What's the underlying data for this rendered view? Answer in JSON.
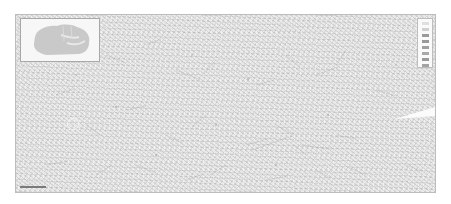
{
  "map": {
    "type": "topographic-map-sheet",
    "background_color": "#e9e9e9",
    "frame_color": "#bdbdbd"
  },
  "overview_inset": {
    "shape_color": "#c9c9c9",
    "background_color": "#f7f7f7"
  },
  "legend": {
    "rows": [
      {
        "color": "#e0e0e0"
      },
      {
        "color": "#d0d0d0"
      },
      {
        "color": "#9a9a9a"
      },
      {
        "color": "#9a9a9a"
      },
      {
        "color": "#a0a0a0"
      },
      {
        "color": "#a8a8a8"
      },
      {
        "color": "#9a9a9a"
      },
      {
        "color": "#a3a3a3"
      }
    ]
  },
  "scale_bar": {
    "label": "~~~"
  }
}
